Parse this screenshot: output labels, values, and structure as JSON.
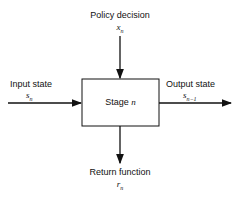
{
  "diagram": {
    "stage_box": {
      "label": "Stage",
      "var": "n"
    },
    "top": {
      "label": "Policy decision",
      "var": "x",
      "sub": "n"
    },
    "left": {
      "label": "Input state",
      "var": "s",
      "sub": "n"
    },
    "right": {
      "label": "Output state",
      "var": "s",
      "sub": "n−1"
    },
    "bottom": {
      "label": "Return function",
      "var": "r",
      "sub": "n"
    }
  }
}
